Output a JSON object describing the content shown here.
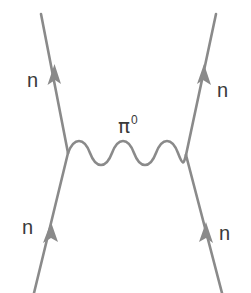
{
  "diagram": {
    "type": "feynman-diagram",
    "colors": {
      "line": "#8a8a8a",
      "text": "#3a3a3a",
      "background": "#ffffff"
    },
    "particles": {
      "top_left": {
        "label": "n",
        "role": "outgoing neutron"
      },
      "top_right": {
        "label": "n",
        "role": "outgoing neutron"
      },
      "bottom_left": {
        "label": "n",
        "role": "incoming neutron"
      },
      "bottom_right": {
        "label": "n",
        "role": "incoming neutron"
      },
      "exchange": {
        "symbol": "π",
        "charge": "0",
        "role": "exchanged neutral pion"
      }
    },
    "vertices": [
      {
        "name": "left-vertex",
        "x": 68,
        "y": 153
      },
      {
        "name": "right-vertex",
        "x": 186,
        "y": 155
      }
    ]
  }
}
